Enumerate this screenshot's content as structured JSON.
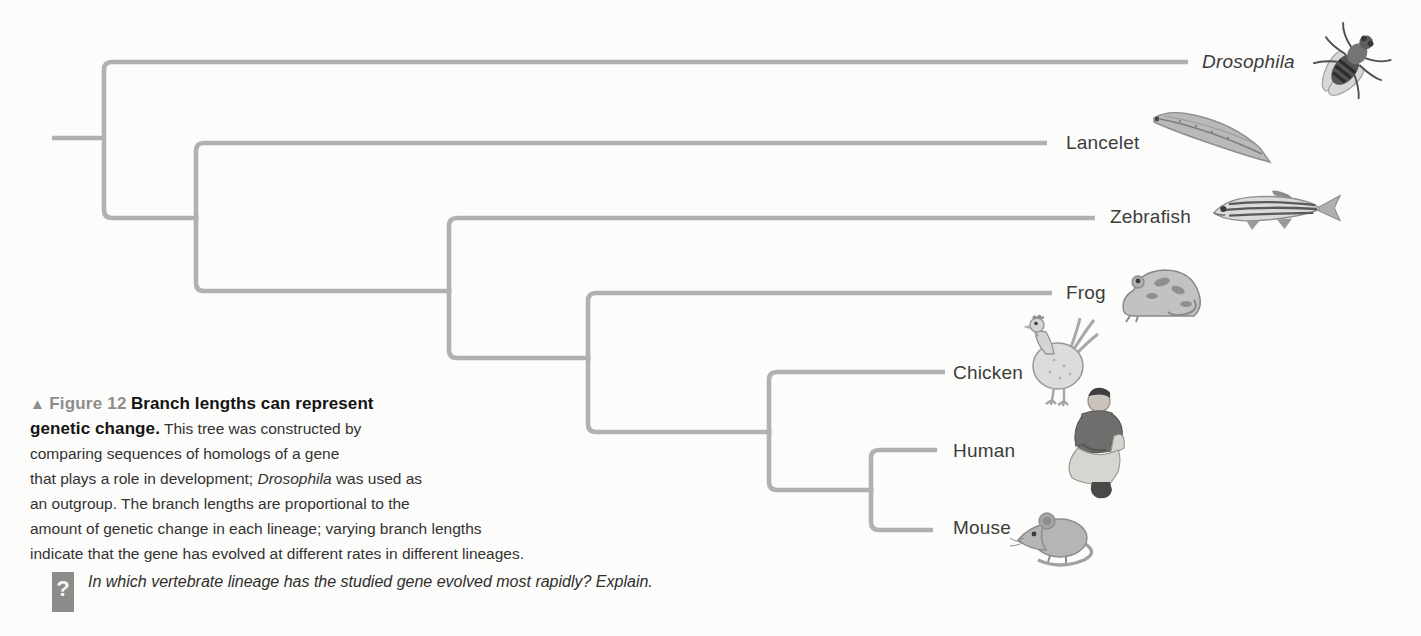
{
  "figure_caption": {
    "marker": "▲",
    "figure_label": "Figure 12",
    "title_line1": "Branch lengths can represent",
    "title_line2_bold": "genetic change.",
    "line2_rest": "This tree was constructed by",
    "line3": "comparing sequences of homologs of a gene",
    "line4_pre": "that plays a role in development;",
    "line4_italic": "Drosophila",
    "line4_post": "was used as",
    "line5": "an outgroup. The branch lengths are proportional to the",
    "line6": "amount of genetic change in each lineage; varying branch lengths",
    "line7": "indicate that the gene has evolved at different rates in different lineages.",
    "question_mark": "?",
    "question": "In which vertebrate lineage has the studied gene evolved most rapidly? Explain."
  },
  "tree": {
    "type": "phylogenetic-tree",
    "topology_newick": "(Drosophila,(Lancelet,(Zebrafish,(Frog,(Chicken,(Human,Mouse))))))",
    "branch_color": "#b2b1af",
    "label_color": "#3d3c3b",
    "taxa": [
      {
        "label": "Drosophila",
        "italic": true,
        "icon": "fruit-fly-image"
      },
      {
        "label": "Lancelet",
        "italic": false,
        "icon": "lancelet-image"
      },
      {
        "label": "Zebrafish",
        "italic": false,
        "icon": "zebrafish-image"
      },
      {
        "label": "Frog",
        "italic": false,
        "icon": "frog-image"
      },
      {
        "label": "Chicken",
        "italic": false,
        "icon": "chicken-image"
      },
      {
        "label": "Human",
        "italic": false,
        "icon": "human-image"
      },
      {
        "label": "Mouse",
        "italic": false,
        "icon": "mouse-image"
      }
    ]
  }
}
